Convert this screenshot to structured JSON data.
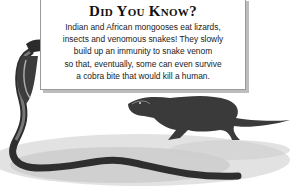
{
  "fact_box": {
    "title": "Did You Know?",
    "lines": [
      "Indian and African mongooses eat lizards,",
      "insects and venomous snakes! They slowly",
      "build up an immunity to snake venom",
      "so that, eventually, some can even survive",
      "a cobra bite that would kill a human."
    ]
  },
  "illustration": {
    "subjects": [
      "cobra",
      "mongoose"
    ],
    "style": "grayscale pencil illustration"
  }
}
